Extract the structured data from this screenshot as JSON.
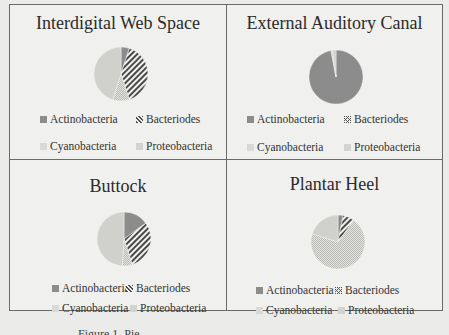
{
  "colors": {
    "actinobacteria": "#8c8c8c",
    "bacteriodes_bg": "#f2f2f0",
    "bacteriodes_line": "#4a4a4a",
    "cyanobacteria": "#d3d3d0",
    "proteobacteria": "#cfcfcc"
  },
  "legend_labels": [
    "Actinobacteria",
    "Bacteriodes",
    "Cyanobacteria",
    "Proteobacteria"
  ],
  "caption": "Figure 1. Pie",
  "chart_data": [
    {
      "type": "pie",
      "title": "Interdigital Web Space",
      "categories": [
        "Actinobacteria",
        "Bacteriodes",
        "Cyanobacteria",
        "Proteobacteria"
      ],
      "values": [
        5,
        40,
        10,
        45
      ],
      "legend_position": "bottom"
    },
    {
      "type": "pie",
      "title": "External Auditory Canal",
      "categories": [
        "Actinobacteria",
        "Bacteriodes",
        "Cyanobacteria",
        "Proteobacteria"
      ],
      "values": [
        97,
        0,
        1,
        2
      ],
      "legend_position": "bottom"
    },
    {
      "type": "pie",
      "title": "Buttock",
      "categories": [
        "Actinobacteria",
        "Bacteriodes",
        "Cyanobacteria",
        "Proteobacteria"
      ],
      "values": [
        15,
        30,
        6,
        49
      ],
      "legend_position": "bottom"
    },
    {
      "type": "pie",
      "title": "Plantar Heel",
      "categories": [
        "Actinobacteria",
        "Bacteriodes",
        "Cyanobacteria",
        "Proteobacteria"
      ],
      "values": [
        3,
        7,
        70,
        20
      ],
      "legend_position": "bottom"
    }
  ]
}
